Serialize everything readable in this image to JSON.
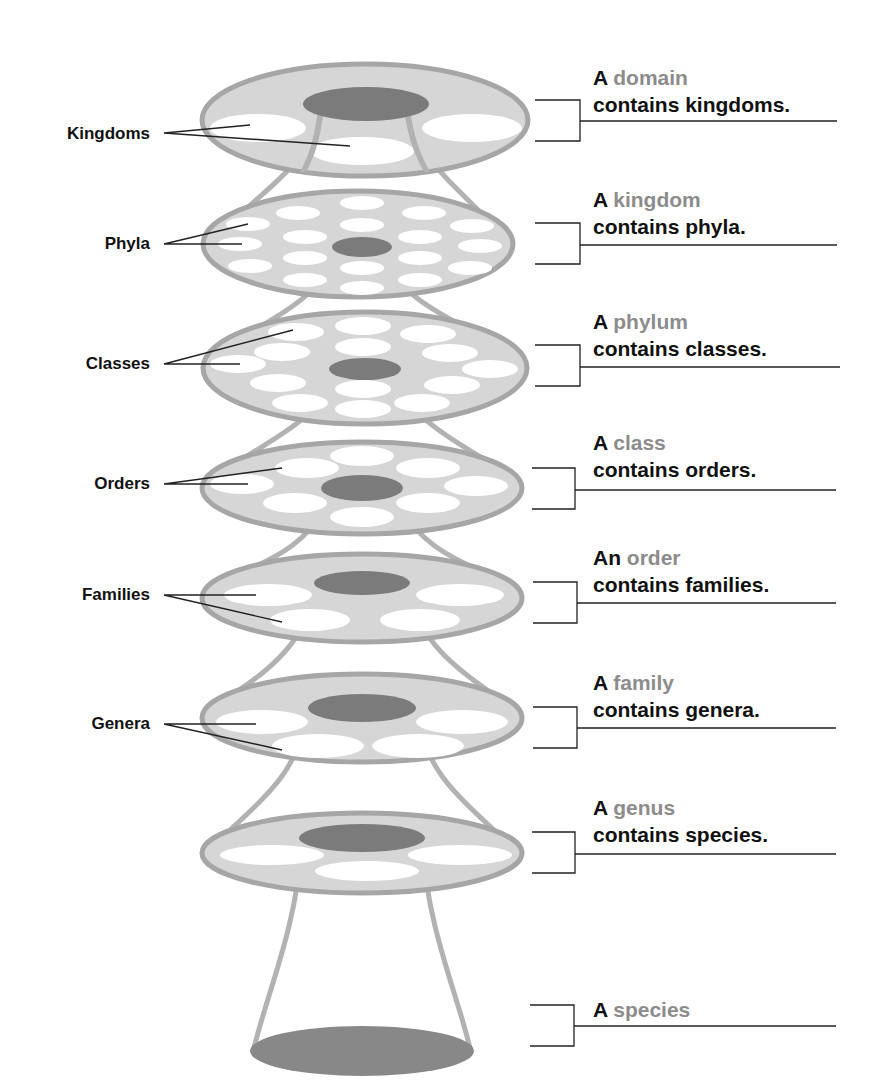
{
  "colors": {
    "disc_fill": "#d6d6d6",
    "disc_rim": "#a8a8a8",
    "inner_dark": "#7b7b7b",
    "hole_fill": "#ffffff",
    "rank_text": "#8c8c8c",
    "text": "#111111",
    "line": "#222222"
  },
  "left_labels": [
    {
      "text": "Kingdoms",
      "x": 0,
      "y": 124
    },
    {
      "text": "Phyla",
      "x": 0,
      "y": 233
    },
    {
      "text": "Classes",
      "x": 0,
      "y": 353
    },
    {
      "text": "Orders",
      "x": 0,
      "y": 474
    },
    {
      "text": "Families",
      "x": 0,
      "y": 584
    },
    {
      "text": "Genera",
      "x": 0,
      "y": 714
    }
  ],
  "levels": [
    {
      "article": "A",
      "rank": "domain",
      "contains": "contains kingdoms."
    },
    {
      "article": "A",
      "rank": "kingdom",
      "contains": "contains phyla."
    },
    {
      "article": "A",
      "rank": "phylum",
      "contains": "contains classes."
    },
    {
      "article": "A",
      "rank": "class",
      "contains": "contains orders."
    },
    {
      "article": "An",
      "rank": "order",
      "contains": "contains families."
    },
    {
      "article": "A",
      "rank": "family",
      "contains": "contains genera."
    },
    {
      "article": "A",
      "rank": "genus",
      "contains": "contains species."
    },
    {
      "article": "A",
      "rank": "species",
      "contains": ""
    }
  ]
}
